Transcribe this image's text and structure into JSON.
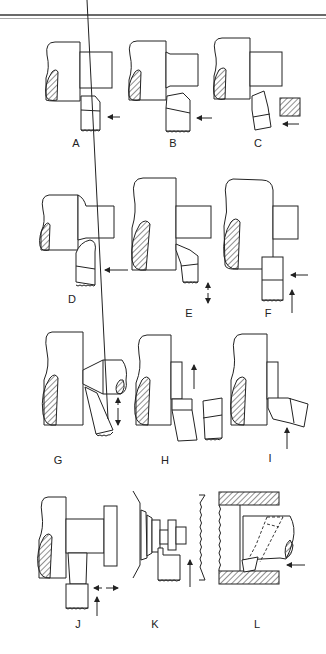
{
  "figure": {
    "panels": [
      {
        "id": "A",
        "label": "A"
      },
      {
        "id": "B",
        "label": "B"
      },
      {
        "id": "C",
        "label": "C"
      },
      {
        "id": "D",
        "label": "D"
      },
      {
        "id": "E",
        "label": "E"
      },
      {
        "id": "F",
        "label": "F"
      },
      {
        "id": "G",
        "label": "G"
      },
      {
        "id": "H",
        "label": "H"
      },
      {
        "id": "I",
        "label": "I"
      },
      {
        "id": "J",
        "label": "J"
      },
      {
        "id": "K",
        "label": "K"
      },
      {
        "id": "L",
        "label": "L"
      }
    ],
    "colors": {
      "line": "#222222",
      "background": "#ffffff",
      "rule_dark": "#6a6a6a",
      "rule_light": "#a8a8a8"
    }
  }
}
